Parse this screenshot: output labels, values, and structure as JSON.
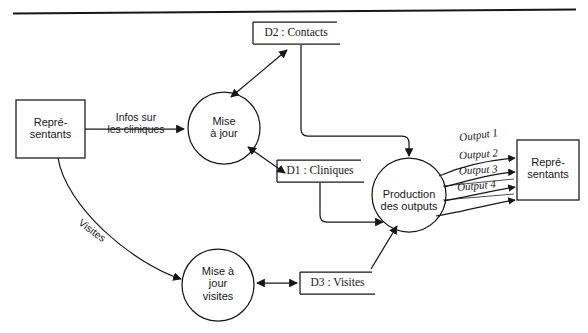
{
  "diagram": {
    "kind": "data-flow-diagram",
    "language": "fr",
    "page_rule": "horizontal-rule-top",
    "background_color": "#ffffff",
    "ink_color": "#17171a",
    "external_entities": [
      {
        "id": "ee-left",
        "label_line1": "Repré-",
        "label_line2": "sentants"
      },
      {
        "id": "ee-right",
        "label_line1": "Repré-",
        "label_line2": "sentants"
      }
    ],
    "processes": [
      {
        "id": "p-maj",
        "label_line1": "Mise",
        "label_line2": "à jour",
        "label_line3": ""
      },
      {
        "id": "p-production",
        "label_line1": "Production",
        "label_line2": "des outputs",
        "label_line3": ""
      },
      {
        "id": "p-maj-visites",
        "label_line1": "Mise à",
        "label_line2": "jour",
        "label_line3": "visites"
      }
    ],
    "data_stores": [
      {
        "id": "d2",
        "label": "D2 :  Contacts"
      },
      {
        "id": "d1",
        "label": "D1 :  Cliniques"
      },
      {
        "id": "d3",
        "label": "D3 :  Visites"
      }
    ],
    "flow_labels": {
      "infos_line1": "Infos sur",
      "infos_line2": "les cliniques",
      "visites": "Visites"
    },
    "outputs": [
      {
        "id": "output-1",
        "label": "Output 1"
      },
      {
        "id": "output-2",
        "label": "Output 2"
      },
      {
        "id": "output-3",
        "label": "Output 3"
      },
      {
        "id": "output-4",
        "label": "Output 4"
      }
    ]
  }
}
